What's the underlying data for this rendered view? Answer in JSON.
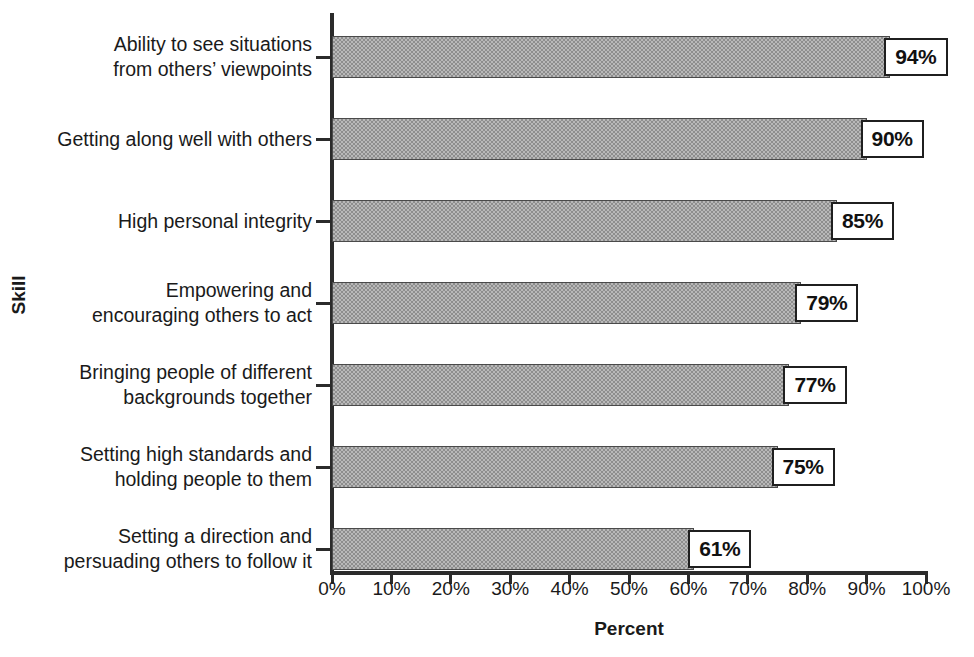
{
  "chart_data": {
    "type": "bar",
    "orientation": "horizontal",
    "title": "",
    "xlabel": "Percent",
    "ylabel": "Skill",
    "xlim": [
      0,
      100
    ],
    "grid": false,
    "legend": null,
    "xtick_labels": [
      "0%",
      "10%",
      "20%",
      "30%",
      "40%",
      "50%",
      "60%",
      "70%",
      "80%",
      "90%",
      "100%"
    ],
    "xtick_values": [
      0,
      10,
      20,
      30,
      40,
      50,
      60,
      70,
      80,
      90,
      100
    ],
    "categories": [
      "Ability to see situations\nfrom others’ viewpoints",
      "Getting along well with others",
      "High personal integrity",
      "Empowering and\nencouraging others to act",
      "Bringing people of different\nbackgrounds together",
      "Setting high standards and\nholding people to them",
      "Setting a direction and\npersuading others to follow it"
    ],
    "values": [
      94,
      90,
      85,
      79,
      77,
      75,
      61
    ],
    "data_labels": [
      "94%",
      "90%",
      "85%",
      "79%",
      "77%",
      "75%",
      "61%"
    ],
    "bar_color": "#8e8e8e",
    "bar_edge_color": "#4a4a4a",
    "axis_color": "#2b2b2b",
    "label_box_background": "#ffffff",
    "label_box_border_color": "#1f1f1f"
  }
}
